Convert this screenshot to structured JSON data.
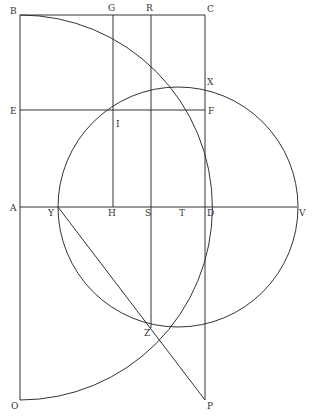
{
  "colors": {
    "stroke": "#333333",
    "background": "#ffffff"
  },
  "points": {
    "B": {
      "label": "B",
      "x": 20,
      "y": 15,
      "lx": 10,
      "ly": 14
    },
    "G": {
      "label": "G",
      "x": 113,
      "y": 15,
      "lx": 108,
      "ly": 11
    },
    "R": {
      "label": "R",
      "x": 151,
      "y": 15,
      "lx": 146,
      "ly": 11
    },
    "C": {
      "label": "C",
      "x": 205,
      "y": 15,
      "lx": 207,
      "ly": 12
    },
    "X": {
      "label": "X",
      "x": 205,
      "y": 86,
      "lx": 207,
      "ly": 85
    },
    "E": {
      "label": "E",
      "x": 20,
      "y": 110,
      "lx": 10,
      "ly": 114
    },
    "F": {
      "label": "F",
      "x": 205,
      "y": 110,
      "lx": 208,
      "ly": 114
    },
    "I": {
      "label": "I",
      "x": 113,
      "y": 110,
      "lx": 116,
      "ly": 127
    },
    "A": {
      "label": "A",
      "x": 20,
      "y": 207,
      "lx": 10,
      "ly": 211
    },
    "Y": {
      "label": "Y",
      "x": 58,
      "y": 207,
      "lx": 48,
      "ly": 216
    },
    "H": {
      "label": "H",
      "x": 113,
      "y": 207,
      "lx": 108,
      "ly": 216
    },
    "S": {
      "label": "S",
      "x": 151,
      "y": 207,
      "lx": 145,
      "ly": 216
    },
    "T": {
      "label": "T",
      "x": 182,
      "y": 207,
      "lx": 179,
      "ly": 216
    },
    "D": {
      "label": "D",
      "x": 205,
      "y": 207,
      "lx": 207,
      "ly": 216
    },
    "V": {
      "label": "V",
      "x": 297,
      "y": 207,
      "lx": 299,
      "ly": 216
    },
    "Z": {
      "label": "Z",
      "x": 151,
      "y": 328,
      "lx": 144,
      "ly": 336
    },
    "O": {
      "label": "O",
      "x": 20,
      "y": 400,
      "lx": 11,
      "ly": 409
    },
    "P": {
      "label": "P",
      "x": 205,
      "y": 400,
      "lx": 207,
      "ly": 409
    }
  },
  "segments": [
    {
      "name": "segment-bc",
      "x1": 20,
      "y1": 15,
      "x2": 205,
      "y2": 15
    },
    {
      "name": "segment-bo",
      "x1": 20,
      "y1": 15,
      "x2": 20,
      "y2": 400
    },
    {
      "name": "segment-cp",
      "x1": 205,
      "y1": 15,
      "x2": 205,
      "y2": 400
    },
    {
      "name": "segment-ef",
      "x1": 20,
      "y1": 110,
      "x2": 205,
      "y2": 110
    },
    {
      "name": "segment-av",
      "x1": 20,
      "y1": 207,
      "x2": 297,
      "y2": 207
    },
    {
      "name": "segment-gh",
      "x1": 113,
      "y1": 15,
      "x2": 113,
      "y2": 207
    },
    {
      "name": "segment-rz",
      "x1": 151,
      "y1": 15,
      "x2": 151,
      "y2": 328
    },
    {
      "name": "segment-yp",
      "x1": 58,
      "y1": 207,
      "x2": 205,
      "y2": 400
    }
  ],
  "circle": {
    "cx": 178,
    "cy": 207,
    "r": 120
  },
  "quarter_arc": {
    "d": "M 20 15 A 192 192 0 0 1 20 400"
  }
}
